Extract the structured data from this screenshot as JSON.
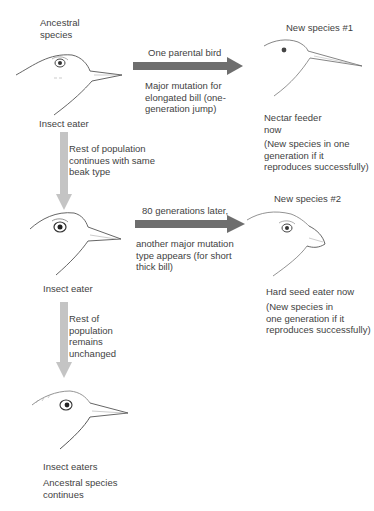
{
  "diagram": {
    "ancestral": {
      "title": "Ancestral\nspecies",
      "caption": "Insect eater"
    },
    "arrow1": {
      "label_top": "One parental bird",
      "label_bottom": "Major mutation for\nelongated bill (one-\ngeneration jump)",
      "color": "#6e6e6e"
    },
    "new_species_1": {
      "title": "New species #1",
      "caption": "Nectar feeder\nnow",
      "note": "(New species in one\ngeneration if it\nreproduces successfully)"
    },
    "down_arrow1": {
      "label": "Rest of population\ncontinues with same\nbeak type",
      "color": "#c4c4c4"
    },
    "generation2": {
      "caption": "Insect eater"
    },
    "arrow2": {
      "label_top": "80 generations later,",
      "label_bottom": "another major mutation\ntype appears (for short\nthick bill)",
      "color": "#6e6e6e"
    },
    "new_species_2": {
      "title": "New species #2",
      "caption": "Hard seed eater now",
      "note": "(New species in\none generation if it\nreproduces successfully)"
    },
    "down_arrow2": {
      "label": "Rest of\npopulation\nremains\nunchanged",
      "color": "#c4c4c4"
    },
    "generation3": {
      "caption": "Insect eaters",
      "note": "Ancestral species\ncontinues"
    }
  }
}
